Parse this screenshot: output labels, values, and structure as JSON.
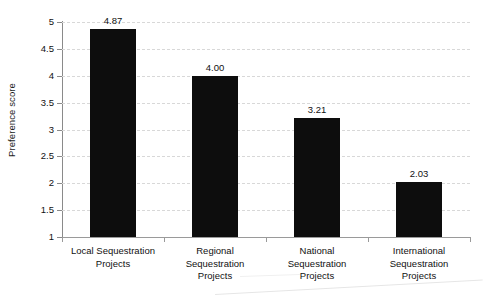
{
  "chart_data": {
    "type": "bar",
    "title": "",
    "xlabel": "",
    "ylabel": "Preference score",
    "ylim": [
      1,
      5
    ],
    "grid": true,
    "legend": "none",
    "orientation": "vertical",
    "bar_color": "#0d0d0d",
    "gridline_color": "#d8d8d8",
    "axis_color": "#8a8a8a",
    "categories": [
      "Local Sequestration Projects",
      "Regional Sequestration Projects",
      "National Sequestration Projects",
      "International Sequestration Projects"
    ],
    "category_label_lines": [
      [
        "Local Sequestration",
        "Projects"
      ],
      [
        "Regional",
        "Sequestration",
        "Projects"
      ],
      [
        "National",
        "Sequestration",
        "Projects"
      ],
      [
        "International",
        "Sequestration",
        "Projects"
      ]
    ],
    "values": [
      4.87,
      4.0,
      3.21,
      2.03
    ],
    "value_labels": [
      "4.87",
      "4.00",
      "3.21",
      "2.03"
    ],
    "ytick_values": [
      1,
      1.5,
      2,
      2.5,
      3,
      3.5,
      4,
      4.5,
      5
    ],
    "ytick_labels": [
      "1",
      "1.5",
      "2",
      "2.5",
      "3",
      "3.5",
      "4",
      "4.5",
      "5"
    ]
  }
}
